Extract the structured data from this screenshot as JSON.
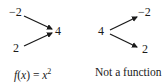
{
  "left_diagram": {
    "inputs": [
      "−2",
      "2"
    ],
    "output": "4",
    "caption": {
      "f": "f",
      "open": "(",
      "x": "x",
      "close": ")",
      "eq": " = ",
      "x2": "x",
      "exp": "2"
    }
  },
  "right_diagram": {
    "input": "4",
    "outputs": [
      "−2",
      "2"
    ],
    "caption": "Not a function"
  },
  "colors": {
    "ink": "#1a1a1a",
    "background": "#ffffff"
  }
}
